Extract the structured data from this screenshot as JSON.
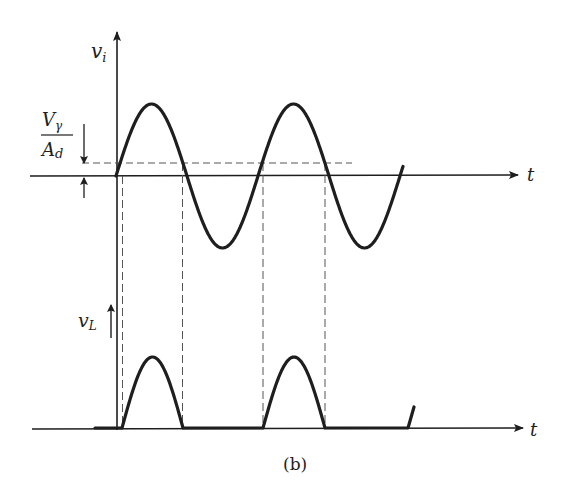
{
  "figure": {
    "caption": "(b)",
    "colors": {
      "ink": "#1e1e1e",
      "dash": "#555555",
      "background": "#ffffff"
    }
  },
  "top_plot": {
    "y_axis_label": {
      "main": "v",
      "sub": "i"
    },
    "x_axis_label": "t",
    "threshold_label": {
      "numerator_main": "V",
      "numerator_sub": "γ",
      "denominator_main": "A",
      "denominator_sub": "d"
    },
    "waveform": {
      "type": "sine",
      "x_start": 116,
      "x_end": 403.5,
      "period": 142,
      "center_y": 176,
      "amplitude": 72
    }
  },
  "bottom_plot": {
    "y_axis_label": {
      "main": "v",
      "sub": "L"
    },
    "x_axis_label": "t",
    "pulses": [
      {
        "x_start": 122,
        "x_end": 183,
        "baseline_y": 428,
        "height": 71
      },
      {
        "x_start": 263,
        "x_end": 325,
        "baseline_y": 428,
        "height": 71
      }
    ]
  }
}
